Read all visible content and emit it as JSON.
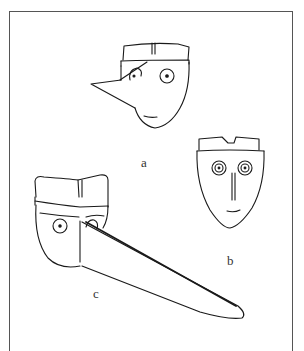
{
  "figure": {
    "labels": {
      "a": "a",
      "b": "b",
      "c": "c"
    },
    "line_color": "#1a1a1a",
    "frame_color": "#555555"
  }
}
